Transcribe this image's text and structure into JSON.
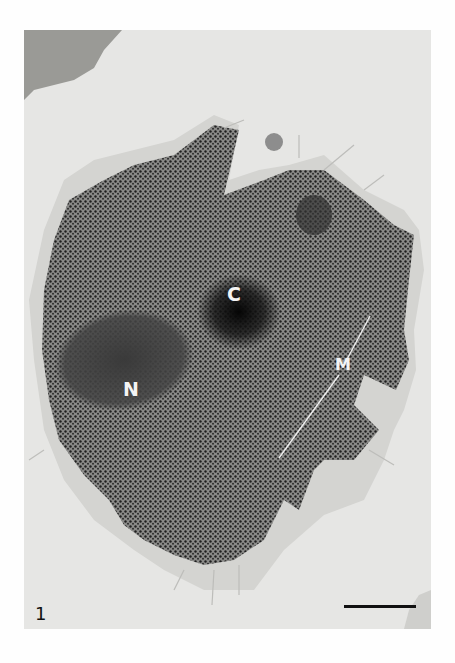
{
  "figure": {
    "number": "1",
    "labels": {
      "centrosome": "C",
      "nucleus": "N",
      "mitochondria": "M"
    },
    "scale_bar": {
      "present": true
    }
  },
  "colors": {
    "background": "#e6e6e4",
    "cell_dark": "#2a2a2a",
    "label_text": "#f4f4f4"
  }
}
